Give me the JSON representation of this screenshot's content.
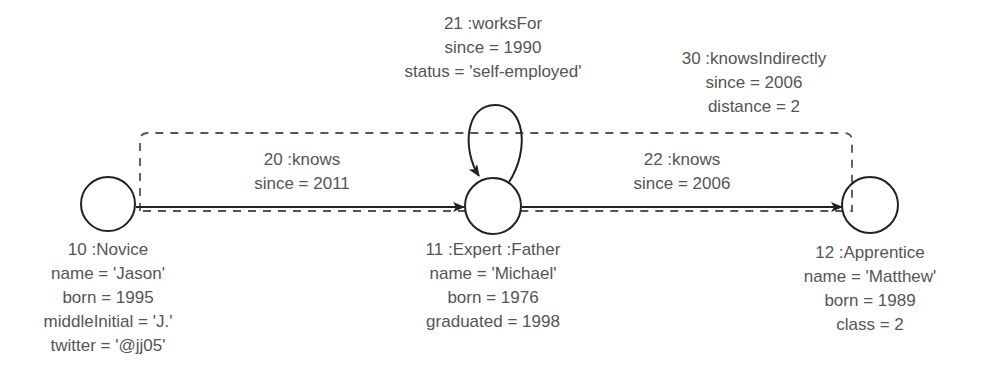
{
  "diagram": {
    "type": "property-graph",
    "colors": {
      "stroke": "#222222",
      "text": "#555555",
      "dashed": "#555555"
    },
    "nodes": [
      {
        "id": "10",
        "labels": ":Novice",
        "title": "10 :Novice",
        "properties": [
          {
            "key": "name",
            "value": "'Jason'",
            "text": "name = 'Jason'"
          },
          {
            "key": "born",
            "value": "1995",
            "text": "born = 1995"
          },
          {
            "key": "middleInitial",
            "value": "'J.'",
            "text": "middleInitial = 'J.'"
          },
          {
            "key": "twitter",
            "value": "'@jj05'",
            "text": "twitter = '@jj05'"
          }
        ]
      },
      {
        "id": "11",
        "labels": ":Expert :Father",
        "title": "11 :Expert :Father",
        "properties": [
          {
            "key": "name",
            "value": "'Michael'",
            "text": "name = 'Michael'"
          },
          {
            "key": "born",
            "value": "1976",
            "text": "born = 1976"
          },
          {
            "key": "graduated",
            "value": "1998",
            "text": "graduated = 1998"
          }
        ]
      },
      {
        "id": "12",
        "labels": ":Apprentice",
        "title": "12 :Apprentice",
        "properties": [
          {
            "key": "name",
            "value": "'Matthew'",
            "text": "name = 'Matthew'"
          },
          {
            "key": "born",
            "value": "1989",
            "text": "born = 1989"
          },
          {
            "key": "class",
            "value": "2",
            "text": "class = 2"
          }
        ]
      }
    ],
    "edges": [
      {
        "id": "20",
        "type": ":knows",
        "title": "20 :knows",
        "from": "10",
        "to": "11",
        "style": "solid",
        "properties": [
          {
            "key": "since",
            "value": "2011",
            "text": "since = 2011"
          }
        ]
      },
      {
        "id": "21",
        "type": ":worksFor",
        "title": "21 :worksFor",
        "from": "11",
        "to": "11",
        "style": "solid-loop",
        "properties": [
          {
            "key": "since",
            "value": "1990",
            "text": "since = 1990"
          },
          {
            "key": "status",
            "value": "'self-employed'",
            "text": "status = 'self-employed'"
          }
        ]
      },
      {
        "id": "22",
        "type": ":knows",
        "title": "22 :knows",
        "from": "11",
        "to": "12",
        "style": "solid",
        "properties": [
          {
            "key": "since",
            "value": "2006",
            "text": "since = 2006"
          }
        ]
      },
      {
        "id": "30",
        "type": ":knowsIndirectly",
        "title": "30 :knowsIndirectly",
        "from": "10",
        "to": "12",
        "style": "dashed",
        "properties": [
          {
            "key": "since",
            "value": "2006",
            "text": "since = 2006"
          },
          {
            "key": "distance",
            "value": "2",
            "text": "distance = 2"
          }
        ]
      }
    ]
  }
}
